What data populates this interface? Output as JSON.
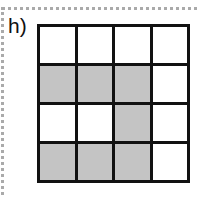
{
  "label": "h)",
  "grid": {
    "rows": 4,
    "cols": 4,
    "shaded": [
      [
        false,
        false,
        false,
        false
      ],
      [
        true,
        true,
        true,
        false
      ],
      [
        false,
        false,
        true,
        false
      ],
      [
        true,
        true,
        true,
        false
      ]
    ],
    "colors": {
      "shaded": "#c4c4c4",
      "empty": "#ffffff",
      "line": "#111111"
    }
  }
}
